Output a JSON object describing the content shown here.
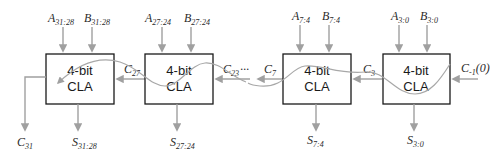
{
  "diagram": {
    "blocks": [
      {
        "id": "cla-31-28",
        "line1": "4-bit",
        "line2": "CLA",
        "a": "A",
        "a_sub": "31:28",
        "b": "B",
        "b_sub": "31:28",
        "s": "S",
        "s_sub": "31:28"
      },
      {
        "id": "cla-27-24",
        "line1": "4-bit",
        "line2": "CLA",
        "a": "A",
        "a_sub": "27:24",
        "b": "B",
        "b_sub": "27:24",
        "s": "S",
        "s_sub": "27:24"
      },
      {
        "id": "cla-7-4",
        "line1": "4-bit",
        "line2": "CLA",
        "a": "A",
        "a_sub": "7:4",
        "b": "B",
        "b_sub": "7:4",
        "s": "S",
        "s_sub": "7:4"
      },
      {
        "id": "cla-3-0",
        "line1": "4-bit",
        "line2": "CLA",
        "a": "A",
        "a_sub": "3:0",
        "b": "B",
        "b_sub": "3:0",
        "s": "S",
        "s_sub": "3:0"
      }
    ],
    "carries": {
      "cin": {
        "c": "C",
        "sub": "-1",
        "suffix": "(0)"
      },
      "c3": {
        "c": "C",
        "sub": "3"
      },
      "c7": {
        "c": "C",
        "sub": "7"
      },
      "c23": {
        "c": "C",
        "sub": "23",
        "ellipsis": "···"
      },
      "c27": {
        "c": "C",
        "sub": "27"
      },
      "c31": {
        "c": "C",
        "sub": "31"
      }
    },
    "colors": {
      "wire": "#a0a0a0",
      "block_border": "#1a1a1a",
      "critical_path": "#a8a8a8"
    }
  }
}
